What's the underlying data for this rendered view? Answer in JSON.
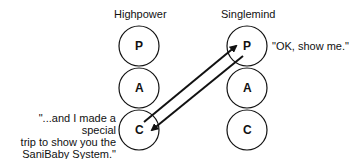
{
  "left": {
    "title": "Highpower",
    "circles": [
      "P",
      "A",
      "C"
    ],
    "quote_lines": [
      "\"...and I made a special",
      "trip to show you the",
      "SaniBaby System.\""
    ]
  },
  "right": {
    "title": "Singlemind",
    "circles": [
      "P",
      "A",
      "C"
    ],
    "quote": "\"OK, show me.\""
  },
  "colors": {
    "stroke": "#111111",
    "background": "#ffffff"
  }
}
